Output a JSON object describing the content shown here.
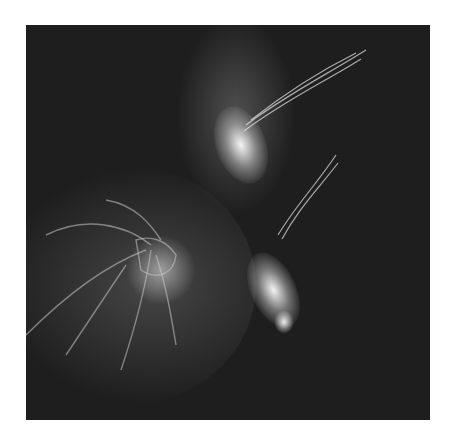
{
  "image": {
    "kind": "grayscale fluorescence micrograph",
    "background": "#ffffff",
    "field_color": "#1e1e1e",
    "highlight_color": "#ffffff",
    "regions": [
      {
        "name": "upper-bright-cluster",
        "x": 215,
        "y": 135
      },
      {
        "name": "lower-bright-cluster",
        "x": 250,
        "y": 270
      },
      {
        "name": "lower-left-network",
        "x": 130,
        "y": 255
      }
    ]
  }
}
